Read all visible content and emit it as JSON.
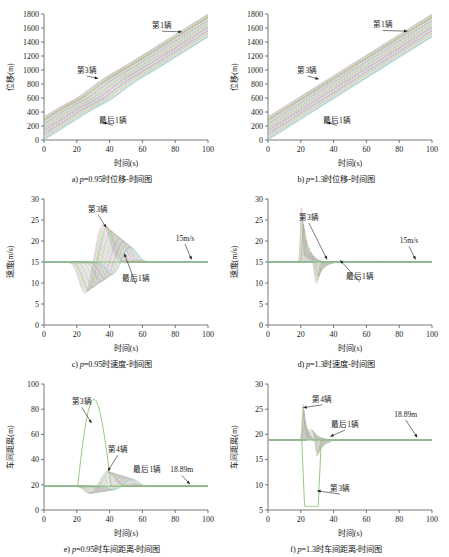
{
  "figure": {
    "title": "",
    "panel_count": 6
  },
  "common": {
    "xlabel": "时间(s)",
    "xticks": [
      0,
      20,
      40,
      60,
      80,
      100
    ],
    "xlim": [
      0,
      100
    ],
    "labels": {
      "first": "第1辆",
      "third": "第3辆",
      "fourth": "第4辆",
      "last": "最后1辆",
      "speed_ref": "15m/s",
      "gap_ref": "18.89m"
    },
    "colors": {
      "green": "#6ab04c",
      "pink": "#e8a0b4",
      "blue": "#8ab4e8",
      "yellow": "#d4c76a",
      "purple": "#b49ad4",
      "axis": "#555555"
    }
  },
  "chart_data": [
    {
      "id": "a",
      "type": "line",
      "title": "a) p=0.95时位移-时间图",
      "caption_prefix": "a) ",
      "caption_var": "p",
      "caption_rest": "=0.95时位移-时间图",
      "xlabel": "时间(s)",
      "ylabel": "位移(m)",
      "xlim": [
        0,
        100
      ],
      "ylim": [
        0,
        1800
      ],
      "yticks": [
        0,
        200,
        400,
        600,
        800,
        1000,
        1200,
        1400,
        1600,
        1800
      ],
      "xticks": [
        0,
        20,
        40,
        60,
        80,
        100
      ],
      "grid": false,
      "series_count": 25,
      "description": "Bundle of near-parallel displacement trajectories rising from ~0-330 m at t=0 to ~1450-1800 m at t=100 s; slight convergence kink near t=35-45 s",
      "series": [
        {
          "name": "第1辆",
          "start": 330,
          "end": 1800,
          "kink_t": 38,
          "kink_dy": 0
        },
        {
          "name": "第3辆",
          "start": 300,
          "end": 1760,
          "kink_t": 36,
          "kink_dy": -15
        },
        {
          "name": "最后1辆",
          "start": 0,
          "end": 1450,
          "kink_t": 44,
          "kink_dy": -25
        }
      ],
      "annotations": [
        {
          "text": "第1辆",
          "x": 72,
          "y": 1600
        },
        {
          "text": "第3辆",
          "x": 26,
          "y": 960
        },
        {
          "text": "最后1辆",
          "x": 42,
          "y": 250
        }
      ]
    },
    {
      "id": "b",
      "type": "line",
      "title": "b) p=1.3时位移-时间图",
      "caption_prefix": "b) ",
      "caption_var": "p",
      "caption_rest": "=1.3时位移-时间图",
      "xlabel": "时间(s)",
      "ylabel": "位移(m)",
      "xlim": [
        0,
        100
      ],
      "ylim": [
        0,
        1800
      ],
      "yticks": [
        0,
        200,
        400,
        600,
        800,
        1000,
        1200,
        1400,
        1600,
        1800
      ],
      "xticks": [
        0,
        20,
        40,
        60,
        80,
        100
      ],
      "grid": false,
      "series_count": 25,
      "description": "Straight parallel displacement lines, no visible kink, from ~0-330 m at t=0 to ~1450-1800 m at t=100 s",
      "series": [
        {
          "name": "第1辆",
          "start": 330,
          "end": 1800
        },
        {
          "name": "第3辆",
          "start": 300,
          "end": 1760
        },
        {
          "name": "最后1辆",
          "start": 0,
          "end": 1450
        }
      ],
      "annotations": [
        {
          "text": "第1辆",
          "x": 70,
          "y": 1610
        },
        {
          "text": "第3辆",
          "x": 24,
          "y": 960
        },
        {
          "text": "最后1辆",
          "x": 42,
          "y": 250
        }
      ]
    },
    {
      "id": "c",
      "type": "line",
      "title": "c) p=0.95时速度-时间图",
      "caption_prefix": "c) ",
      "caption_var": "p",
      "caption_rest": "=0.95时速度-时间图",
      "xlabel": "时间(s)",
      "ylabel": "速度(m/s)",
      "xlim": [
        0,
        100
      ],
      "ylim": [
        0,
        30
      ],
      "yticks": [
        0,
        5,
        10,
        15,
        20,
        25,
        30
      ],
      "xticks": [
        0,
        20,
        40,
        60,
        80,
        100
      ],
      "grid": false,
      "series_count": 25,
      "equilibrium": 15,
      "description": "Speeds hold 15 m/s until t=20 s, dip to a minimum ~7.5 m/s near t=26 s, overshoot to ~24 m/s near t=37 s, then damped oscillation relaxing back to 15 m/s by t=70 s; later vehicles lag and damp more",
      "series": [
        {
          "name": "第3辆",
          "dip_t": 26,
          "dip_v": 7.5,
          "peak_t": 37,
          "peak_v": 24,
          "return_t": 55
        },
        {
          "name": "最后1辆",
          "dip_t": 42,
          "dip_v": 10.5,
          "peak_t": 53,
          "peak_v": 18.5,
          "return_t": 70
        }
      ],
      "annotations": [
        {
          "text": "第3辆",
          "x": 33,
          "y": 27
        },
        {
          "text": "最后1辆",
          "x": 56,
          "y": 10.5
        },
        {
          "text": "15m/s",
          "x": 86,
          "y": 20
        }
      ]
    },
    {
      "id": "d",
      "type": "line",
      "title": "d) p=1.3时速度-时间图",
      "caption_prefix": "d) ",
      "caption_var": "p",
      "caption_rest": "=1.3时速度-时间图",
      "xlabel": "时间(s)",
      "ylabel": "速度(m/s)",
      "xlim": [
        0,
        100
      ],
      "ylim": [
        0,
        30
      ],
      "yticks": [
        0,
        5,
        10,
        15,
        20,
        25,
        30
      ],
      "xticks": [
        0,
        20,
        40,
        60,
        80,
        100
      ],
      "grid": false,
      "series_count": 25,
      "equilibrium": 15,
      "description": "Flat at 15 m/s, then a sharp narrow spike to ~27.5 m/s at t=20 s followed by a drop to ~10 m/s near t=30 s; disturbance is strongly damped and vanishes by t=55 s",
      "series": [
        {
          "name": "第3辆",
          "spike_t": 20,
          "spike_v": 27.5,
          "dip_t": 30,
          "dip_v": 10,
          "return_t": 33
        },
        {
          "name": "最后1辆",
          "spike_t": 30,
          "spike_v": 16,
          "dip_t": 40,
          "dip_v": 14,
          "return_t": 55
        }
      ],
      "annotations": [
        {
          "text": "第3辆",
          "x": 25,
          "y": 25
        },
        {
          "text": "最后1辆",
          "x": 56,
          "y": 11
        },
        {
          "text": "15m/s",
          "x": 86,
          "y": 19.5
        }
      ]
    },
    {
      "id": "e",
      "type": "line",
      "title": "e) p=0.95时车间距离-时间图",
      "caption_prefix": "e) ",
      "caption_var": "p",
      "caption_rest": "=0.95时车间距离-时间图",
      "xlabel": "时间(s)",
      "ylabel": "车间距离(m)",
      "xlim": [
        0,
        100
      ],
      "ylim": [
        0,
        100
      ],
      "yticks": [
        0,
        20,
        40,
        60,
        80,
        100
      ],
      "xticks": [
        0,
        20,
        40,
        60,
        80,
        100
      ],
      "grid": false,
      "series_count": 25,
      "equilibrium": 18.89,
      "description": "Gaps sit at 18.89 m; vehicle 3 gap balloons to a peak of ~88 m near t=31 s then collapses back by t=40 s. Following vehicles show small dips to ~13 m near t=28 s and modest humps to ~30 m near t=40 s, all relaxing to 18.89 m by t=70 s",
      "series": [
        {
          "name": "第3辆",
          "peak_t": 31,
          "peak_v": 88,
          "rise_t": 21,
          "fall_t": 40
        },
        {
          "name": "第4辆",
          "peak_t": 39,
          "peak_v": 31,
          "dip_t": 28,
          "dip_v": 13
        },
        {
          "name": "最后1辆",
          "peak_t": 52,
          "peak_v": 25,
          "dip_t": 42,
          "dip_v": 16
        }
      ],
      "annotations": [
        {
          "text": "第3辆",
          "x": 23,
          "y": 84
        },
        {
          "text": "第4辆",
          "x": 45,
          "y": 46
        },
        {
          "text": "最后1辆",
          "x": 63,
          "y": 30
        },
        {
          "text": "18.89m",
          "x": 84,
          "y": 30
        }
      ]
    },
    {
      "id": "f",
      "type": "line",
      "title": "f) p=1.3时车间距离-时间图",
      "caption_prefix": "f) ",
      "caption_var": "p",
      "caption_rest": "=1.3时车间距离-时间图",
      "xlabel": "时间(s)",
      "ylabel": "车间距离(m)",
      "xlim": [
        5,
        30
      ],
      "ylim": [
        5,
        30
      ],
      "yticks": [
        5,
        10,
        15,
        20,
        25,
        30
      ],
      "xticks": [
        0,
        20,
        40,
        60,
        80,
        100
      ],
      "grid": false,
      "series_count": 25,
      "equilibrium": 18.89,
      "description": "Gaps at 18.89 m; vehicle 3 gap plunges to a flat floor of ~5.7 m between t=22 s and t=31 s then springs back. Vehicle 4 spikes up to ~26 m at t=21 s; the remaining vehicles show a fanned bundle of small oscillations between 15 and 22 m, settling to 18.89 m by t=60 s",
      "series": [
        {
          "name": "第3辆",
          "floor_v": 5.7,
          "floor_start": 22,
          "floor_end": 31
        },
        {
          "name": "第4辆",
          "spike_t": 21,
          "spike_v": 26,
          "dip_t": 30,
          "dip_v": 14.5
        },
        {
          "name": "最后1辆",
          "peak_t": 33,
          "peak_v": 21.5,
          "dip_t": 40,
          "dip_v": 17.5
        }
      ],
      "annotations": [
        {
          "text": "第4辆",
          "x": 33,
          "y": 26.5
        },
        {
          "text": "最后1辆",
          "x": 47,
          "y": 21.5
        },
        {
          "text": "第3辆",
          "x": 44,
          "y": 8.8
        },
        {
          "text": "18.89m",
          "x": 84,
          "y": 23.5
        }
      ]
    }
  ]
}
